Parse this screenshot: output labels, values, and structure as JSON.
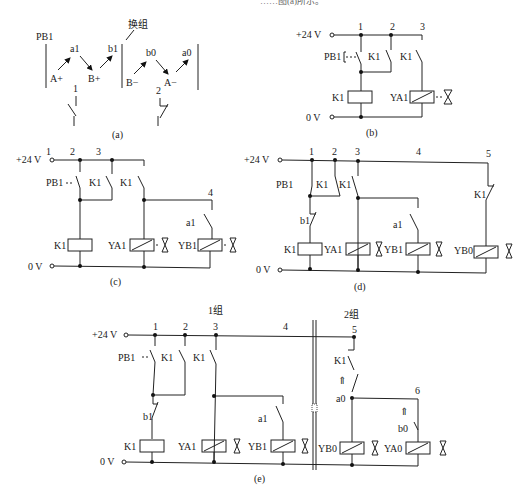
{
  "header_fragment": "……图(a)所示。",
  "panel_a": {
    "caption": "(a)",
    "pb_label": "PB1",
    "group_switch_label": "换组",
    "group1_steps": [
      "A+",
      "a1",
      "B+",
      "b1"
    ],
    "group2_steps": [
      "B−",
      "b0",
      "A−",
      "a0"
    ],
    "line1_label": "1",
    "line2_label": "2"
  },
  "panel_b": {
    "caption": "(b)",
    "supply_plus": "+24 V",
    "supply_zero": "0 V",
    "nodes": [
      "1",
      "2",
      "3"
    ],
    "pushbutton": "PB1",
    "contacts": [
      "K1",
      "K1"
    ],
    "relay": "K1",
    "solenoids": [
      "YA1"
    ]
  },
  "panel_c": {
    "caption": "(c)",
    "supply_plus": "+24 V",
    "supply_zero": "0 V",
    "nodes": [
      "1",
      "2",
      "3",
      "4"
    ],
    "pushbutton": "PB1",
    "contacts": [
      "K1",
      "K1"
    ],
    "limit_switch": "a1",
    "relay": "K1",
    "solenoids": [
      "YA1",
      "YB1"
    ]
  },
  "panel_d": {
    "caption": "(d)",
    "supply_plus": "+24 V",
    "supply_zero": "0 V",
    "nodes": [
      "1",
      "2",
      "3",
      "4",
      "5"
    ],
    "pushbutton": "PB1",
    "contacts": [
      "K1",
      "K1",
      "K1"
    ],
    "limit_switches": [
      "b1",
      "a1"
    ],
    "relay": "K1",
    "solenoids": [
      "YA1",
      "YB1",
      "YB0"
    ]
  },
  "panel_e": {
    "caption": "(e)",
    "supply_plus": "+24 V",
    "supply_zero": "0 V",
    "group1_label": "1组",
    "group2_label": "2组",
    "nodes": [
      "1",
      "2",
      "3",
      "4",
      "5",
      "6"
    ],
    "pushbutton": "PB1",
    "contacts": [
      "K1",
      "K1",
      "K1"
    ],
    "limit_switches": [
      "b1",
      "a1",
      "a0",
      "b0"
    ],
    "relay": "K1",
    "solenoids": [
      "YA1",
      "YB1",
      "YB0",
      "YA0"
    ]
  }
}
